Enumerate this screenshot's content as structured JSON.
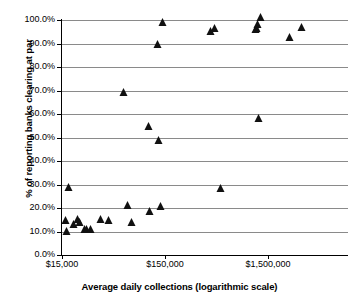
{
  "chart_data": {
    "type": "scatter",
    "title": "",
    "xlabel": "Average daily collections (logarithmic scale)",
    "ylabel": "% of reporting banks clearing at par",
    "x_scale": "log",
    "xlim": [
      15000,
      4500000
    ],
    "ylim": [
      0,
      1.0
    ],
    "grid": true,
    "legend": "none",
    "x_tick_labels": [
      "$15,000",
      "$150,000",
      "$1,500,000"
    ],
    "x_tick_values": [
      15000,
      150000,
      1500000
    ],
    "y_tick_labels": [
      "0.0%",
      "10.0%",
      "20.0%",
      "30.0%",
      "40.0%",
      "50.0%",
      "60.0%",
      "70.0%",
      "80.0%",
      "90.0%",
      "100.0%"
    ],
    "y_tick_values": [
      0,
      10,
      20,
      30,
      40,
      50,
      60,
      70,
      80,
      90,
      100
    ],
    "marker": "triangle",
    "marker_color": "#111111",
    "points": [
      {
        "x": 17500,
        "y": 27.2
      },
      {
        "x": 16500,
        "y": 13.2
      },
      {
        "x": 16800,
        "y": 8.7
      },
      {
        "x": 19500,
        "y": 11.4
      },
      {
        "x": 21500,
        "y": 13.8
      },
      {
        "x": 22500,
        "y": 12.3
      },
      {
        "x": 25000,
        "y": 9.5
      },
      {
        "x": 26500,
        "y": 9.3
      },
      {
        "x": 28500,
        "y": 9.2
      },
      {
        "x": 36000,
        "y": 13.5
      },
      {
        "x": 43000,
        "y": 13.0
      },
      {
        "x": 60000,
        "y": 67.6
      },
      {
        "x": 65000,
        "y": 19.4
      },
      {
        "x": 72000,
        "y": 12.2
      },
      {
        "x": 105000,
        "y": 53.0
      },
      {
        "x": 108000,
        "y": 17.0
      },
      {
        "x": 128000,
        "y": 88.1
      },
      {
        "x": 132000,
        "y": 47.3
      },
      {
        "x": 138000,
        "y": 19.3
      },
      {
        "x": 142000,
        "y": 97.4
      },
      {
        "x": 420000,
        "y": 93.6
      },
      {
        "x": 455000,
        "y": 94.8
      },
      {
        "x": 520000,
        "y": 27.0
      },
      {
        "x": 1150000,
        "y": 94.3
      },
      {
        "x": 1180000,
        "y": 95.1
      },
      {
        "x": 1210000,
        "y": 96.5
      },
      {
        "x": 1290000,
        "y": 99.4
      },
      {
        "x": 1230000,
        "y": 56.4
      },
      {
        "x": 2450000,
        "y": 91.0
      },
      {
        "x": 3200000,
        "y": 95.3
      }
    ]
  }
}
